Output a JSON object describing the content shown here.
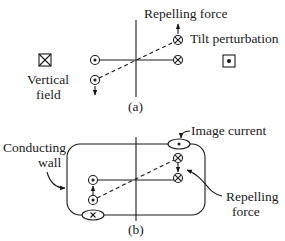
{
  "panel_a": {
    "caption": "(a)",
    "labels": {
      "repelling_force": "Repelling force",
      "tilt_perturbation": "Tilt perturbation",
      "vertical_field_line1": "Vertical",
      "vertical_field_line2": "field"
    },
    "symbols": {
      "current_out": "dot-in-circle",
      "current_in": "cross-in-circle",
      "field_into_page": "cross-in-square",
      "field_out_of_page": "dot-in-square"
    }
  },
  "panel_b": {
    "caption": "(b)",
    "labels": {
      "image_current": "Image current",
      "conducting_wall_line1": "Conducting",
      "conducting_wall_line2": "wall",
      "repelling_force_line1": "Repelling",
      "repelling_force_line2": "force"
    }
  },
  "colors": {
    "ink": "#1a1a1a",
    "background": "#ffffff"
  }
}
